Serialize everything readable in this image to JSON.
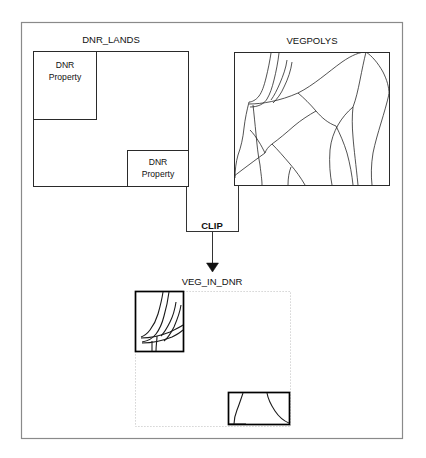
{
  "diagram": {
    "title_visible": false,
    "operation": {
      "name": "CLIP",
      "label": "CLIP"
    },
    "inputs": [
      {
        "id": "dnr-lands",
        "label": "DNR_LANDS",
        "role": "clip-input-features",
        "parcels": [
          {
            "label_line1": "DNR",
            "label_line2": "Property",
            "position": "upper-left"
          },
          {
            "label_line1": "DNR",
            "label_line2": "Property",
            "position": "lower-right"
          }
        ]
      },
      {
        "id": "vegpolys",
        "label": "VEGPOLYS",
        "role": "clip-overlay-features",
        "content": "vegetation polygons"
      }
    ],
    "output": {
      "id": "veg-in-dnr",
      "label": "VEG_IN_DNR",
      "role": "clip-output",
      "pieces": [
        {
          "position": "upper-left",
          "source_parcel": "DNR Property"
        },
        {
          "position": "lower-right",
          "source_parcel": "DNR Property"
        }
      ]
    },
    "colors": {
      "frame_stroke": "#888888",
      "box_stroke": "#222222",
      "result_stroke": "#000000",
      "dotted_stroke": "#bbbbbb",
      "connector_stroke": "#333333",
      "text": "#111111",
      "background": "#ffffff"
    }
  }
}
